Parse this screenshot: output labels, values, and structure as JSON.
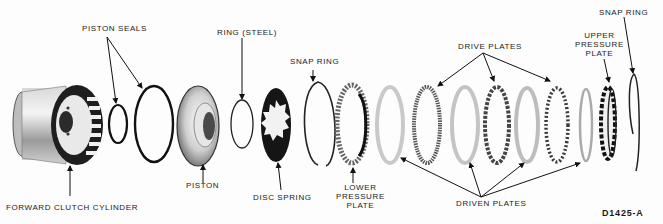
{
  "diagram": {
    "figure_code": "D1425-A",
    "style": "grayscale technical illustration",
    "labels": [
      {
        "id": "piston-seals",
        "text": "PISTON SEALS",
        "points_to": [
          "small seal ring",
          "large seal ring"
        ]
      },
      {
        "id": "ring-steel",
        "text": "RING (STEEL)",
        "points_to": [
          "steel ring"
        ]
      },
      {
        "id": "snap-ring-1",
        "text": "SNAP RING",
        "points_to": [
          "first snap ring"
        ]
      },
      {
        "id": "drive-plates",
        "text": "DRIVE PLATES",
        "points_to": [
          "drive plate 1",
          "drive plate 2",
          "drive plate 3"
        ]
      },
      {
        "id": "upper-pressure-plate",
        "lines": [
          "UPPER",
          "PRESSURE",
          "PLATE"
        ],
        "points_to": [
          "upper pressure plate"
        ]
      },
      {
        "id": "snap-ring-2",
        "text": "SNAP RING",
        "points_to": [
          "final snap ring"
        ]
      },
      {
        "id": "forward-clutch-cylinder",
        "text": "FORWARD CLUTCH CYLINDER",
        "points_to": [
          "cylinder"
        ]
      },
      {
        "id": "piston",
        "text": "PISTON",
        "points_to": [
          "piston"
        ]
      },
      {
        "id": "disc-spring",
        "text": "DISC SPRING",
        "points_to": [
          "disc spring"
        ]
      },
      {
        "id": "lower-pressure-plate",
        "lines": [
          "LOWER",
          "PRESSURE",
          "PLATE"
        ],
        "points_to": [
          "lower pressure plate"
        ]
      },
      {
        "id": "driven-plates",
        "text": "DRIVEN PLATES",
        "points_to": [
          "driven plate 1",
          "driven plate 2",
          "driven plate 3",
          "driven plate 4"
        ]
      }
    ],
    "parts_left_to_right": [
      "Forward clutch cylinder",
      "Piston seal (small)",
      "Piston seal (large)",
      "Piston",
      "Ring (steel)",
      "Disc spring",
      "Snap ring",
      "Lower pressure plate",
      "Driven plate",
      "Drive plate",
      "Driven plate",
      "Drive plate",
      "Driven plate",
      "Drive plate",
      "Driven plate",
      "Upper pressure plate",
      "Snap ring"
    ]
  }
}
